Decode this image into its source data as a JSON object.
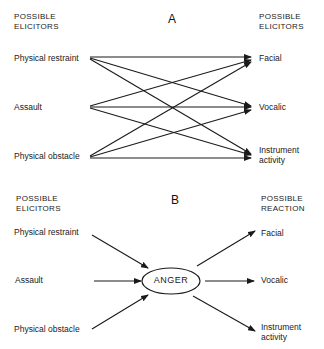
{
  "panel_a": {
    "letter": "A",
    "left_header": [
      "POSSIBLE",
      "ELICITORS"
    ],
    "right_header": [
      "POSSIBLE",
      "ELICITORS"
    ],
    "elicitors": [
      "Physical restraint",
      "Assault",
      "Physical obstacle"
    ],
    "reactions": [
      "Facial",
      "Vocalic",
      "Instrument",
      "activity"
    ],
    "connections": "every elicitor connects to every reaction (3x3)"
  },
  "panel_b": {
    "letter": "B",
    "left_header": [
      "POSSIBLE",
      "ELICITORS"
    ],
    "right_header": [
      "POSSIBLE",
      "REACTION"
    ],
    "elicitors": [
      "Physical restraint",
      "Assault",
      "Physical obstacle"
    ],
    "center_node": "ANGER",
    "reactions": [
      "Facial",
      "Vocalic",
      "Instrument",
      "activity"
    ]
  }
}
